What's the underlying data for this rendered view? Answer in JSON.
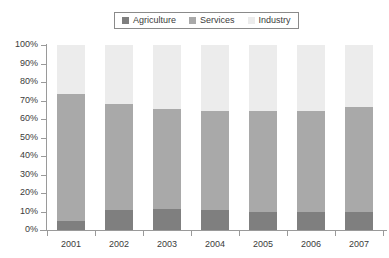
{
  "chart_data": {
    "type": "bar",
    "subtype": "stacked-percentage",
    "title": "",
    "xlabel": "",
    "ylabel": "",
    "categories": [
      "2001",
      "2002",
      "2003",
      "2004",
      "2005",
      "2006",
      "2007"
    ],
    "ylim": [
      0,
      100
    ],
    "yticks": [
      0,
      10,
      20,
      30,
      40,
      50,
      60,
      70,
      80,
      90,
      100
    ],
    "ytick_labels": [
      "0%",
      "10%",
      "20%",
      "30%",
      "40%",
      "50%",
      "60%",
      "70%",
      "80%",
      "90%",
      "100%"
    ],
    "grid": false,
    "legend_position": "top-center",
    "series": [
      {
        "name": "Agriculture",
        "color": "#7f7f7f",
        "values": [
          5.0,
          11.0,
          11.5,
          11.0,
          9.5,
          9.5,
          9.5
        ]
      },
      {
        "name": "Services",
        "color": "#a9a9a9",
        "values": [
          68.5,
          57.0,
          54.0,
          53.5,
          55.0,
          55.0,
          57.0
        ]
      },
      {
        "name": "Industry",
        "color": "#ececec",
        "values": [
          26.5,
          32.0,
          34.5,
          35.5,
          35.5,
          35.5,
          33.5
        ]
      }
    ],
    "cumulative_tops": {
      "agriculture": [
        5.0,
        11.0,
        11.5,
        11.0,
        9.5,
        9.5,
        9.5
      ],
      "services": [
        73.5,
        68.0,
        65.5,
        64.5,
        64.5,
        64.5,
        66.5
      ],
      "industry": [
        100,
        100,
        100,
        100,
        100,
        100,
        100
      ]
    }
  },
  "legend": {
    "items": [
      {
        "label": "Agriculture",
        "color": "#7f7f7f"
      },
      {
        "label": "Services",
        "color": "#a9a9a9"
      },
      {
        "label": "Industry",
        "color": "#ececec"
      }
    ]
  },
  "axes": {
    "y_labels": [
      "100%",
      "90%",
      "80%",
      "70%",
      "60%",
      "50%",
      "40%",
      "30%",
      "20%",
      "10%",
      "0%"
    ],
    "x_labels": [
      "2001",
      "2002",
      "2003",
      "2004",
      "2005",
      "2006",
      "2007"
    ]
  },
  "colors": {
    "agriculture": "#7f7f7f",
    "services": "#a9a9a9",
    "industry": "#ececec",
    "axis": "#9a9a9a",
    "text": "#3b3b3b",
    "background": "#ffffff"
  }
}
